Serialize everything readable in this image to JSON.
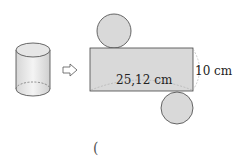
{
  "diagram": {
    "net_labels": {
      "length": "25,12 cm",
      "height": "10 cm"
    },
    "arrow": "⇨",
    "answer_bracket": "("
  },
  "colors": {
    "face_fill": "#d9d9d9",
    "stroke": "#444444",
    "dash": "#aaaaaa"
  }
}
